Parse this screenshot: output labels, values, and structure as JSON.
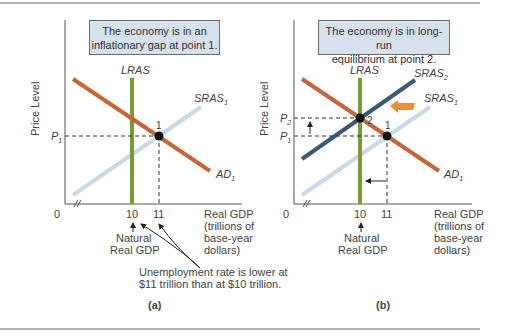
{
  "colors": {
    "ad": "#c8643a",
    "lras": "#7a9a3a",
    "sras1": "#c9d8e6",
    "sras2": "#3b5a78",
    "note_bg": "#d7e1ec",
    "shift_arrow": "#e8903a"
  },
  "panels": [
    {
      "id": "a",
      "caption": "(a)",
      "note": "The economy is in an inflationary gap at point 1.",
      "ylabel": "Price Level",
      "xlabel": [
        "Real GDP",
        "(trillions of",
        "base-year",
        "dollars)"
      ],
      "origin_label": "0",
      "x_ticks": [
        "10",
        "11"
      ],
      "y_ticks": [
        "P1"
      ],
      "curves": [
        "LRAS",
        "SRAS1",
        "AD1"
      ],
      "points": [
        "1"
      ],
      "natural_label": [
        "Natural",
        "Real GDP"
      ],
      "annotation": [
        "Unemployment rate is lower at",
        "$11 trillion than at $10 trillion."
      ]
    },
    {
      "id": "b",
      "caption": "(b)",
      "note": "The economy is in long-run equilibrium at point 2.",
      "ylabel": "Price Level",
      "xlabel": [
        "Real GDP",
        "(trillions of",
        "base-year",
        "dollars)"
      ],
      "origin_label": "0",
      "x_ticks": [
        "10",
        "11"
      ],
      "y_ticks": [
        "P2",
        "P1"
      ],
      "curves": [
        "LRAS",
        "SRAS2",
        "SRAS1",
        "AD1"
      ],
      "points": [
        "2",
        "1"
      ],
      "natural_label": [
        "Natural",
        "Real GDP"
      ]
    }
  ],
  "text": {
    "a_note_1": "The economy is in an",
    "a_note_2": "inflationary gap at point 1.",
    "b_note_1": "The economy is in long-run",
    "b_note_2": "equilibrium at point 2.",
    "price_level": "Price Level",
    "lras": "LRAS",
    "sras": "SRAS",
    "ad": "AD",
    "sub1": "1",
    "sub2": "2",
    "p": "P",
    "zero": "0",
    "ten": "10",
    "eleven": "11",
    "pt1": "1",
    "pt2": "2",
    "real_gdp": "Real GDP",
    "trillions": "(trillions of",
    "base_year": "base-year",
    "dollars": "dollars)",
    "natural": "Natural",
    "natural_gdp": "Real GDP",
    "unemp_1": "Unemployment rate is lower at",
    "unemp_2": "$11 trillion than at $10 trillion.",
    "cap_a": "(a)",
    "cap_b": "(b)"
  }
}
